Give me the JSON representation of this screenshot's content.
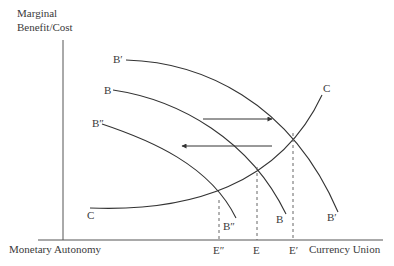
{
  "diagram": {
    "y_axis_label_line1": "Marginal",
    "y_axis_label_line2": "Benefit/Cost",
    "x_axis_left_label": "Monetary Autonomy",
    "x_axis_right_label": "Currency Union",
    "curves": {
      "b_prime": {
        "start_label": "B′",
        "end_label": "B′"
      },
      "b": {
        "start_label": "B",
        "end_label": "B"
      },
      "b_double_prime": {
        "start_label": "B″",
        "end_label": "B″"
      },
      "c": {
        "start_label": "C",
        "end_label": "C"
      }
    },
    "equilibria": [
      {
        "label": "E″"
      },
      {
        "label": "E"
      },
      {
        "label": "E′"
      }
    ],
    "arrows": [
      {
        "direction": "right"
      },
      {
        "direction": "left"
      }
    ]
  }
}
